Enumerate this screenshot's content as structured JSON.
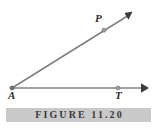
{
  "figure": {
    "caption": "FIGURE  11.20",
    "caption_bar_color": "#c9c9c9",
    "background_color": "#ffffff",
    "line_color": "#808080",
    "label_color": "#2b2b2b",
    "points": {
      "vertex": {
        "label": "A",
        "x": 12,
        "y": 88
      },
      "horizontal_point": {
        "label": "T",
        "x": 118,
        "y": 88
      },
      "diagonal_point": {
        "label": "P",
        "x": 104,
        "y": 30
      }
    },
    "rays": {
      "horizontal": {
        "from": "A",
        "through": "T",
        "arrow_tip_x": 148,
        "arrow_tip_y": 88
      },
      "diagonal": {
        "from": "A",
        "through": "P",
        "arrow_tip_x": 132,
        "arrow_tip_y": 12
      }
    }
  }
}
